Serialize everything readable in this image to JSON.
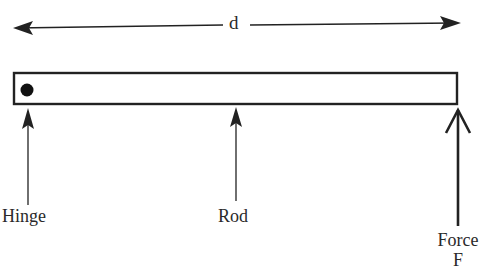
{
  "diagram": {
    "type": "lever-rod-free-body",
    "dimension": {
      "label": "d",
      "description": "distance from hinge to applied force"
    },
    "rod": {
      "label": "Rod"
    },
    "hinge": {
      "label": "Hinge"
    },
    "force": {
      "label_line1": "Force",
      "label_line2": "F"
    },
    "colors": {
      "stroke": "#222222",
      "background": "#ffffff"
    }
  }
}
